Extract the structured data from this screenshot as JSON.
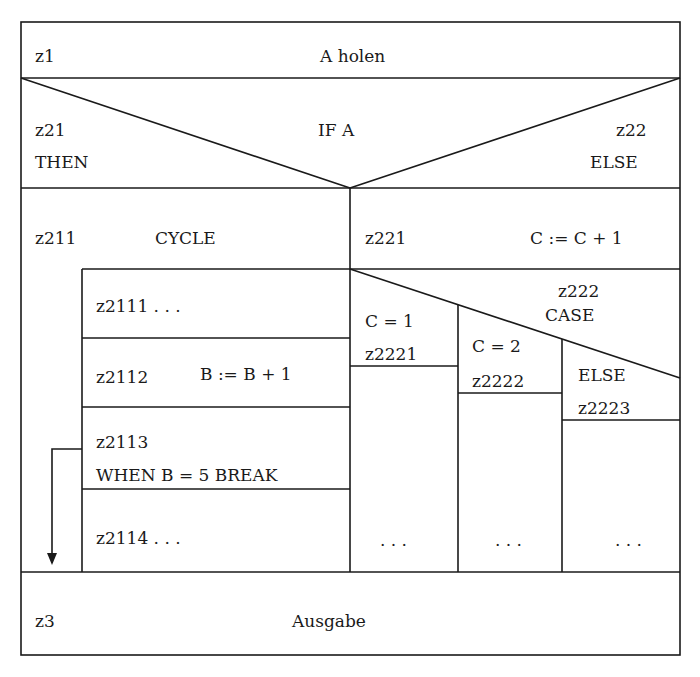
{
  "diagram": {
    "type": "Nassi-Shneiderman structogram",
    "blocks": {
      "z1": {
        "id": "z1",
        "text": "A holen"
      },
      "if": {
        "condition": "IF A",
        "then": {
          "id": "z21",
          "label": "THEN"
        },
        "else": {
          "id": "z22",
          "label": "ELSE"
        }
      },
      "cycle": {
        "id": "z211",
        "label": "CYCLE",
        "body": [
          {
            "id": "z2111",
            "text": "z2111 . . ."
          },
          {
            "id": "z2112",
            "text": "B := B + 1"
          },
          {
            "id": "z2113",
            "text": "WHEN B = 5 BREAK"
          },
          {
            "id": "z2114",
            "text": "z2114 . . ."
          }
        ]
      },
      "z221": {
        "id": "z221",
        "text": "C := C + 1"
      },
      "case": {
        "id": "z222",
        "label": "CASE",
        "branches": [
          {
            "cond": "C = 1",
            "id": "z2221",
            "body": ". . ."
          },
          {
            "cond": "C = 2",
            "id": "z2222",
            "body": ". . ."
          },
          {
            "cond": "ELSE",
            "id": "z2223",
            "body": ". . ."
          }
        ]
      },
      "z3": {
        "id": "z3",
        "text": "Ausgabe"
      }
    }
  }
}
